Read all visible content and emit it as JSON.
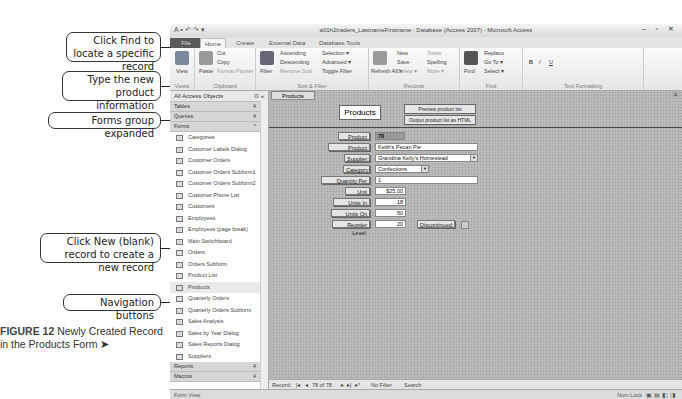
{
  "callouts": [
    {
      "text": "Click Find to locate a specific record"
    },
    {
      "text": "Type the new product information"
    },
    {
      "text": "Forms group expanded"
    },
    {
      "text": "Click New (blank) record to create a new record"
    },
    {
      "text": "Navigation buttons"
    }
  ],
  "caption": {
    "figure": "FIGURE 12",
    "text": "Newly Created Record in the Products Form ➤"
  },
  "window": {
    "title": "a01h2traders_LastnameFirstname : Database (Access 2007) - Microsoft Access",
    "winbuttons": "– ▫ ✕"
  },
  "ribbon": {
    "tabs": [
      "File",
      "Home",
      "Create",
      "External Data",
      "Database Tools"
    ],
    "groups": {
      "views": {
        "label": "Views",
        "view": "View"
      },
      "clipboard": {
        "label": "Clipboard",
        "paste": "Paste",
        "cut": "Cut",
        "copy": "Copy",
        "format_painter": "Format Painter"
      },
      "sort_filter": {
        "label": "Sort & Filter",
        "filter": "Filter",
        "ascending": "Ascending",
        "descending": "Descending",
        "remove_sort": "Remove Sort",
        "selection": "Selection ▾",
        "advanced": "Advanced ▾",
        "toggle_filter": "Toggle Filter"
      },
      "records": {
        "label": "Records",
        "refresh": "Refresh All ▾",
        "new": "New",
        "save": "Save",
        "delete": "Delete ▾",
        "totals": "Totals",
        "spelling": "Spelling",
        "more": "More ▾"
      },
      "find": {
        "label": "Find",
        "find": "Find",
        "replace": "Replace",
        "goto": "Go To ▾",
        "select": "Select ▾"
      },
      "text_formatting": {
        "label": "Text Formatting",
        "bold": "B",
        "italic": "I",
        "underline": "U"
      }
    }
  },
  "nav_pane": {
    "header": "All Access Objects",
    "groups": {
      "tables": "Tables",
      "queries": "Queries",
      "forms": "Forms",
      "reports": "Reports",
      "macros": "Macros"
    },
    "forms": [
      "Categories",
      "Customer Labels Dialog",
      "Customer Orders",
      "Customer Orders Subform1",
      "Customer Orders Subform2",
      "Customer Phone List",
      "Customers",
      "Employees",
      "Employees (page break)",
      "Main Switchboard",
      "Orders",
      "Orders Subform",
      "Product List",
      "Products",
      "Quarterly Orders",
      "Quarterly Orders Subform",
      "Sales Analysis",
      "Sales by Year Dialog",
      "Sales Reports Dialog",
      "Suppliers"
    ],
    "selected": "Products"
  },
  "document": {
    "tab": "Products",
    "form_title": "Products",
    "buttons": {
      "preview": "Preview product list",
      "output": "Output product list as HTML"
    },
    "fields": {
      "product_id": {
        "label": "Product ID:",
        "value": "78"
      },
      "product_name": {
        "label": "Product Name:",
        "value": "Keith's Pecan Pie"
      },
      "supplier": {
        "label": "Supplier:",
        "value": "Grandma Kelly's Homestead"
      },
      "category": {
        "label": "Category:",
        "value": "Confections"
      },
      "qty_per_unit": {
        "label": "Quantity Per Unit:",
        "value": "1"
      },
      "unit_price": {
        "label": "Unit Price:",
        "value": "$25.00"
      },
      "units_in_stock": {
        "label": "Units In Stock:",
        "value": "18"
      },
      "units_on_order": {
        "label": "Units On Order:",
        "value": "50"
      },
      "reorder_level": {
        "label": "Reorder Level:",
        "value": "20"
      },
      "discontinued": {
        "label": "Discontinued:"
      }
    }
  },
  "record_nav": {
    "label": "Record:",
    "first": "|◂",
    "prev": "◂",
    "position": "78 of 78",
    "next": "▸",
    "last": "▸|",
    "new": "▸*",
    "filter": "No Filter",
    "search": "Search"
  },
  "status": {
    "left": "Form View",
    "right": "Num Lock"
  }
}
